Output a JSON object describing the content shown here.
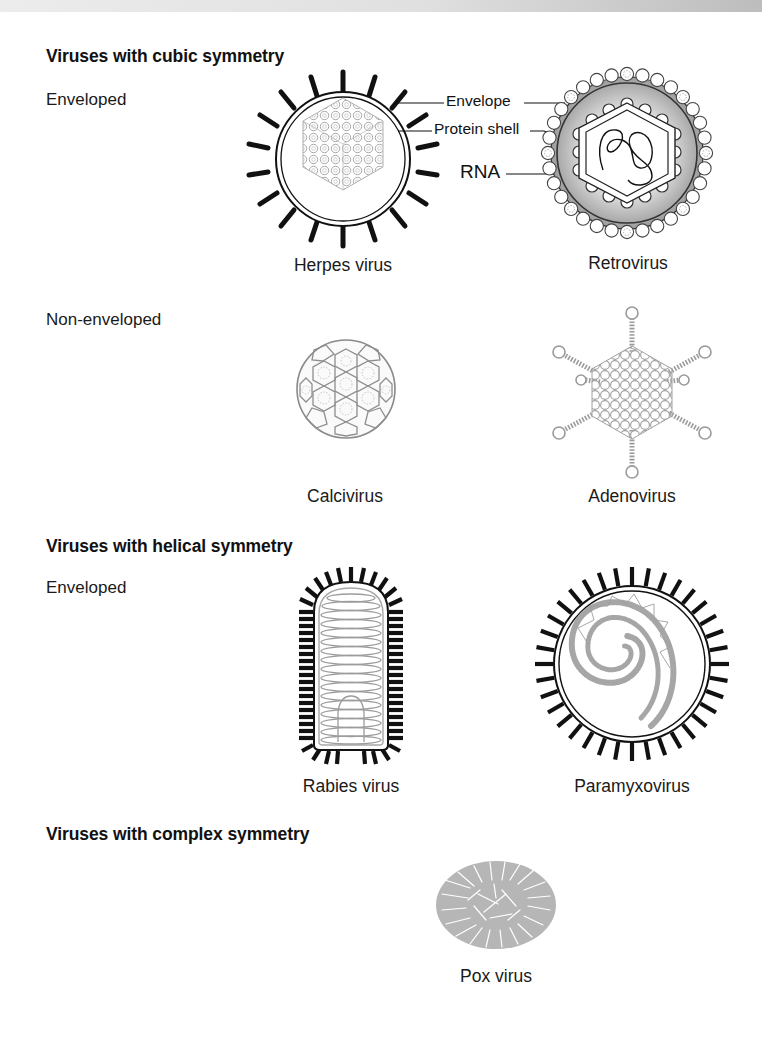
{
  "figure": {
    "sections": [
      {
        "heading": "Viruses with cubic symmetry",
        "groups": [
          {
            "label": "Enveloped",
            "viruses": [
              {
                "name": "Herpes virus"
              },
              {
                "name": "Retrovirus"
              }
            ]
          },
          {
            "label": "Non-enveloped",
            "viruses": [
              {
                "name": "Calcivirus"
              },
              {
                "name": "Adenovirus"
              }
            ]
          }
        ]
      },
      {
        "heading": "Viruses with helical symmetry",
        "groups": [
          {
            "label": "Enveloped",
            "viruses": [
              {
                "name": "Rabies virus"
              },
              {
                "name": "Paramyxovirus"
              }
            ]
          }
        ]
      },
      {
        "heading": "Viruses with complex symmetry",
        "groups": [
          {
            "label": "",
            "viruses": [
              {
                "name": "Pox virus"
              }
            ]
          }
        ]
      }
    ],
    "callouts": {
      "envelope": "Envelope",
      "protein_shell": "Protein shell",
      "rna": "RNA"
    },
    "colors": {
      "ink": "#111111",
      "grey_line": "#9a9a9a",
      "retro_fill": "#a8a8a8",
      "retro_fill_light": "#d6d6d6"
    }
  }
}
